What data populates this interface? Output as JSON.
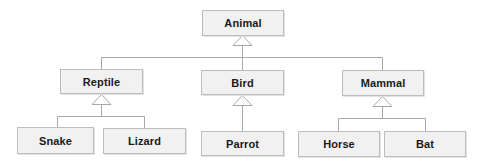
{
  "diagram": {
    "type": "uml-class-inheritance-tree",
    "colors": {
      "box_fill": "#f1f1f1",
      "box_border": "#bdbdbd",
      "line": "#a8a8a8",
      "text": "#1a1a1a"
    },
    "root": {
      "id": "animal",
      "label": "Animal"
    },
    "level1": [
      {
        "id": "reptile",
        "label": "Reptile",
        "parent": "Animal"
      },
      {
        "id": "bird",
        "label": "Bird",
        "parent": "Animal"
      },
      {
        "id": "mammal",
        "label": "Mammal",
        "parent": "Animal"
      }
    ],
    "level2": [
      {
        "id": "snake",
        "label": "Snake",
        "parent": "Reptile"
      },
      {
        "id": "lizard",
        "label": "Lizard",
        "parent": "Reptile"
      },
      {
        "id": "parrot",
        "label": "Parrot",
        "parent": "Bird"
      },
      {
        "id": "horse",
        "label": "Horse",
        "parent": "Mammal"
      },
      {
        "id": "bat",
        "label": "Bat",
        "parent": "Mammal"
      }
    ],
    "relationship": "generalization (hollow triangle arrowhead)"
  }
}
